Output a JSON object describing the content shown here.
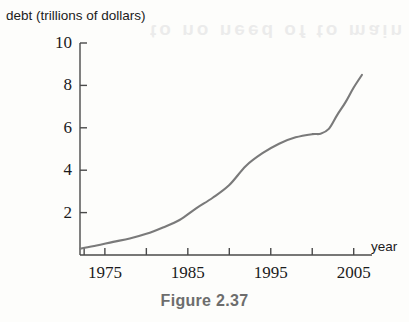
{
  "figure": {
    "caption": "Figure 2.37",
    "bleed_text": "to no need of to main"
  },
  "chart_data": {
    "type": "line",
    "title": "",
    "xlabel": "year",
    "ylabel": "debt (trillions of dollars)",
    "xlim": [
      1972,
      2006
    ],
    "ylim": [
      0,
      10
    ],
    "grid": false,
    "legend": "none",
    "line_color": "#7a7a7a",
    "axis_color": "#4a4a4a",
    "y_ticks": [
      10,
      8,
      6,
      4,
      2
    ],
    "x_ticks": [
      1975,
      1985,
      1995,
      2005
    ],
    "x_tick_marks": [
      1972.5,
      1975,
      1980,
      1985,
      1990,
      1995,
      2000,
      2005
    ],
    "series": [
      {
        "name": "national debt",
        "x": [
          1972,
          1974,
          1976,
          1978,
          1980,
          1982,
          1984,
          1986,
          1988,
          1990,
          1992,
          1994,
          1996,
          1998,
          2000,
          2001,
          2002,
          2003,
          2004,
          2005,
          2006
        ],
        "values": [
          0.3,
          0.45,
          0.62,
          0.78,
          1.0,
          1.3,
          1.65,
          2.2,
          2.7,
          3.3,
          4.2,
          4.8,
          5.25,
          5.55,
          5.7,
          5.72,
          5.95,
          6.6,
          7.2,
          7.9,
          8.5
        ]
      }
    ]
  }
}
